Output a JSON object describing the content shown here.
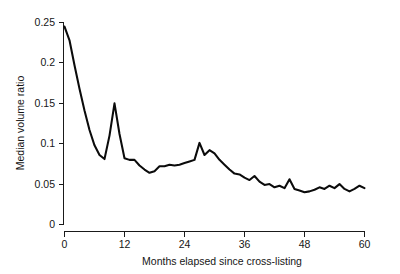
{
  "chart_data": {
    "type": "line",
    "title": "",
    "xlabel": "Months elapsed since cross-listing",
    "ylabel": "Median volume ratio",
    "xlim": [
      0,
      60
    ],
    "ylim": [
      0,
      0.25
    ],
    "grid": false,
    "legend": null,
    "xticks": [
      0,
      12,
      24,
      36,
      48,
      60
    ],
    "xtick_labels": [
      "0",
      "12",
      "24",
      "36",
      "48",
      "60"
    ],
    "yticks": [
      0,
      0.05,
      0.1,
      0.15,
      0.2,
      0.25
    ],
    "ytick_labels": [
      "0",
      "0.05",
      "0.1",
      "0.15",
      "0.2",
      "0.25"
    ],
    "series": [
      {
        "name": "Median volume ratio",
        "color": "#0b0b0b",
        "x": [
          0,
          1,
          2,
          3,
          4,
          5,
          6,
          7,
          8,
          9,
          10,
          11,
          12,
          13,
          14,
          15,
          16,
          17,
          18,
          19,
          20,
          21,
          22,
          23,
          24,
          25,
          26,
          27,
          28,
          29,
          30,
          31,
          32,
          33,
          34,
          35,
          36,
          37,
          38,
          39,
          40,
          41,
          42,
          43,
          44,
          45,
          46,
          47,
          48,
          49,
          50,
          51,
          52,
          53,
          54,
          55,
          56,
          57,
          58,
          59,
          60
        ],
        "y": [
          0.245,
          0.228,
          0.197,
          0.168,
          0.141,
          0.117,
          0.098,
          0.086,
          0.081,
          0.11,
          0.15,
          0.112,
          0.082,
          0.08,
          0.08,
          0.073,
          0.068,
          0.064,
          0.066,
          0.072,
          0.072,
          0.074,
          0.073,
          0.074,
          0.076,
          0.078,
          0.08,
          0.101,
          0.086,
          0.092,
          0.088,
          0.08,
          0.074,
          0.068,
          0.063,
          0.062,
          0.058,
          0.055,
          0.06,
          0.053,
          0.049,
          0.05,
          0.046,
          0.048,
          0.045,
          0.056,
          0.044,
          0.042,
          0.04,
          0.041,
          0.043,
          0.046,
          0.044,
          0.048,
          0.045,
          0.05,
          0.044,
          0.041,
          0.044,
          0.048,
          0.045
        ],
        "note": "monthly median volume ratio, sampled from the plotted curve"
      }
    ]
  },
  "axis": {
    "y_label": "Median volume ratio",
    "x_label": "Months elapsed since cross-listing"
  }
}
